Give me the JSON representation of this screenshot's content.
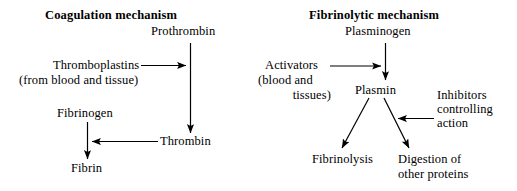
{
  "figure": {
    "background_color": "#ffffff",
    "ink_color": "#000000",
    "width": 517,
    "height": 191
  },
  "panels": {
    "coagulation": {
      "title": "Coagulation mechanism",
      "nodes": {
        "prothrombin": "Prothrombin",
        "thromboplastins": "Thromboplastins",
        "thromboplastins_source": "(from blood and tissue)",
        "fibrinogen": "Fibrinogen",
        "thrombin": "Thrombin",
        "fibrin": "Fibrin"
      }
    },
    "fibrinolytic": {
      "title": "Fibrinolytic mechanism",
      "nodes": {
        "plasminogen": "Plasminogen",
        "activators_line1": "Activators",
        "activators_line2": "(blood and",
        "activators_line3": "tissues)",
        "plasmin": "Plasmin",
        "inhibitors_line1": "Inhibitors",
        "inhibitors_line2": "controlling",
        "inhibitors_line3": "action",
        "fibrinolysis": "Fibrinolysis",
        "digestion_line1": "Digestion of",
        "digestion_line2": "other proteins"
      }
    }
  },
  "arrows": [
    {
      "name": "prothrombin-to-thrombin",
      "from": "Prothrombin",
      "to": "Thrombin",
      "direction": "down"
    },
    {
      "name": "thromboplastins-to-pathway",
      "from": "Thromboplastins",
      "to": "Prothrombin-Thrombin conversion",
      "direction": "right"
    },
    {
      "name": "thrombin-to-fibrinogen-pathway",
      "from": "Thrombin",
      "to": "Fibrinogen-Fibrin conversion",
      "direction": "left"
    },
    {
      "name": "fibrinogen-to-fibrin",
      "from": "Fibrinogen",
      "to": "Fibrin",
      "direction": "down"
    },
    {
      "name": "plasminogen-to-plasmin",
      "from": "Plasminogen",
      "to": "Plasmin",
      "direction": "down"
    },
    {
      "name": "activators-to-pathway",
      "from": "Activators (blood and tissues)",
      "to": "Plasminogen-Plasmin conversion",
      "direction": "right"
    },
    {
      "name": "plasmin-to-fibrinolysis",
      "from": "Plasmin",
      "to": "Fibrinolysis",
      "direction": "down-left"
    },
    {
      "name": "plasmin-to-digestion",
      "from": "Plasmin",
      "to": "Digestion of other proteins",
      "direction": "down-right"
    },
    {
      "name": "inhibitors-to-plasmin-pathway",
      "from": "Inhibitors controlling action",
      "to": "Plasmin pathway",
      "direction": "left"
    }
  ]
}
